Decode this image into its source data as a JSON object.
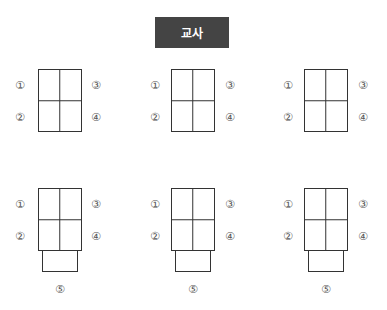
{
  "teacher": {
    "label": "교사",
    "color": "#444444"
  },
  "seat_labels": {
    "s1": "①",
    "s2": "②",
    "s3": "③",
    "s4": "④",
    "s5": "⑤"
  },
  "groups": [
    {
      "row": 1,
      "col": 1,
      "seats": [
        "①",
        "②",
        "③",
        "④"
      ]
    },
    {
      "row": 1,
      "col": 2,
      "seats": [
        "①",
        "②",
        "③",
        "④"
      ]
    },
    {
      "row": 1,
      "col": 3,
      "seats": [
        "①",
        "②",
        "③",
        "④"
      ]
    },
    {
      "row": 2,
      "col": 1,
      "seats": [
        "①",
        "②",
        "③",
        "④",
        "⑤"
      ]
    },
    {
      "row": 2,
      "col": 2,
      "seats": [
        "①",
        "②",
        "③",
        "④",
        "⑤"
      ]
    },
    {
      "row": 2,
      "col": 3,
      "seats": [
        "①",
        "②",
        "③",
        "④",
        "⑤"
      ]
    }
  ]
}
